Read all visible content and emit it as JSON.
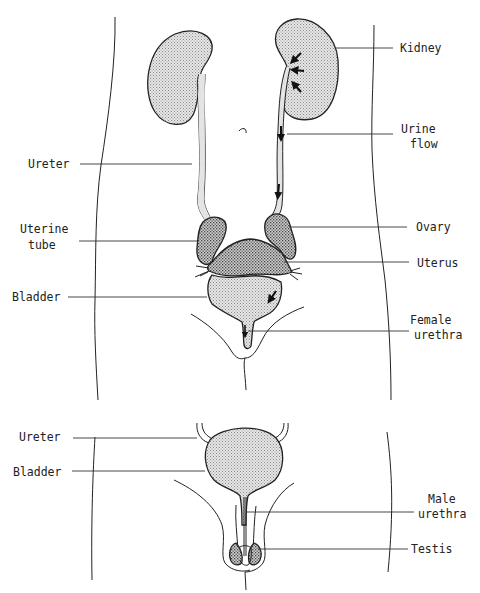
{
  "diagram": {
    "type": "anatomical-diagram",
    "colors": {
      "line": "#222222",
      "fill_light": "#d9d9d9",
      "fill_dark": "#bdbdbd",
      "background": "#ffffff"
    },
    "female": {
      "labels": [
        {
          "id": "kidney",
          "lines": [
            "Kidney"
          ]
        },
        {
          "id": "urine-flow",
          "lines": [
            "Urine",
            "flow"
          ]
        },
        {
          "id": "ureter",
          "lines": [
            "Ureter"
          ]
        },
        {
          "id": "uterine-tube",
          "lines": [
            "Uterine",
            "tube"
          ]
        },
        {
          "id": "ovary",
          "lines": [
            "Ovary"
          ]
        },
        {
          "id": "uterus",
          "lines": [
            "Uterus"
          ]
        },
        {
          "id": "bladder",
          "lines": [
            "Bladder"
          ]
        },
        {
          "id": "female-urethra",
          "lines": [
            "Female",
            "urethra"
          ]
        }
      ]
    },
    "male": {
      "labels": [
        {
          "id": "ureter",
          "lines": [
            "Ureter"
          ]
        },
        {
          "id": "bladder",
          "lines": [
            "Bladder"
          ]
        },
        {
          "id": "male-urethra",
          "lines": [
            "Male",
            "urethra"
          ]
        },
        {
          "id": "testis",
          "lines": [
            "Testis"
          ]
        }
      ]
    }
  }
}
